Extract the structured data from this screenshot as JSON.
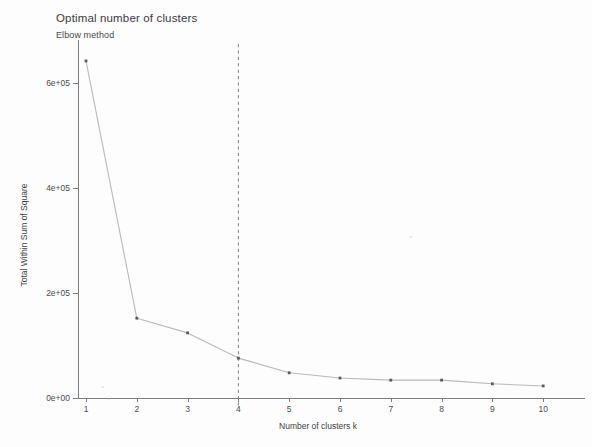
{
  "chart_data": {
    "type": "line",
    "title": "Optimal number of clusters",
    "subtitle": "Elbow method",
    "xlabel": "Number of clusters k",
    "ylabel": "Total Within Sum of Square",
    "x": [
      1,
      2,
      3,
      4,
      5,
      6,
      7,
      8,
      9,
      10
    ],
    "values": [
      642000,
      152000,
      124000,
      76000,
      48000,
      38000,
      34000,
      34000,
      27000,
      23000
    ],
    "categories": [
      "1",
      "2",
      "3",
      "4",
      "5",
      "6",
      "7",
      "8",
      "9",
      "10"
    ],
    "xtick_labels": [
      "1",
      "2",
      "3",
      "4",
      "5",
      "6",
      "7",
      "8",
      "9",
      "10"
    ],
    "ytick_labels": [
      "0e+00",
      "2e+05",
      "4e+05",
      "6e+05"
    ],
    "ytick_values": [
      0,
      200000,
      400000,
      600000
    ],
    "xlim": [
      0.6,
      10.4
    ],
    "ylim": [
      0,
      660000
    ],
    "grid": false,
    "legend": "none",
    "annotations": [
      {
        "name": "optimal-k-line",
        "type": "vline",
        "x": 4,
        "style": "dashed",
        "color": "#6f6f8a"
      }
    ],
    "series_color": "#b9b9b9",
    "marker_color": "#5a5a5a",
    "marker_shape": "square"
  },
  "axis": {
    "line_color": "#7d7d7d"
  }
}
